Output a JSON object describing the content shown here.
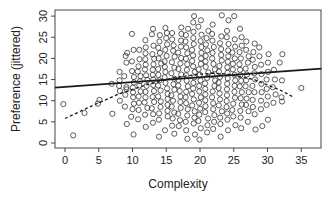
{
  "chart_data": {
    "type": "scatter",
    "title": "",
    "xlabel": "Complexity",
    "ylabel": "Preference (jittered)",
    "xlim": [
      -1.5,
      38
    ],
    "ylim": [
      -0.5,
      31
    ],
    "x_ticks": [
      0,
      5,
      10,
      15,
      20,
      25,
      30,
      35
    ],
    "y_ticks": [
      0,
      5,
      10,
      15,
      20,
      25,
      30
    ],
    "grid": false,
    "legend": null,
    "point_style": "open circle",
    "columns": [
      {
        "x": 0,
        "y": [
          9.2
        ]
      },
      {
        "x": 1,
        "y": [
          1.8
        ]
      },
      {
        "x": 3,
        "y": [
          7.1
        ]
      },
      {
        "x": 5,
        "y": [
          9.3,
          10.2
        ]
      },
      {
        "x": 7,
        "y": [
          6.9,
          14.0
        ]
      },
      {
        "x": 8,
        "y": [
          10.0,
          12.3,
          13.5,
          14.8,
          16.8
        ]
      },
      {
        "x": 9,
        "y": [
          4.5,
          8.6,
          11.4,
          12.7,
          13.2,
          15.8,
          19.0,
          20.6,
          21.3
        ]
      },
      {
        "x": 10,
        "y": [
          2.0,
          6.2,
          8.0,
          9.3,
          10.8,
          12.0,
          13.1,
          14.3,
          15.6,
          17.0,
          19.3,
          22.0,
          25.8
        ]
      },
      {
        "x": 11,
        "y": [
          5.6,
          7.8,
          9.5,
          11.0,
          12.2,
          13.6,
          14.6,
          15.8,
          16.9,
          18.1,
          19.8,
          22.0
        ]
      },
      {
        "x": 12,
        "y": [
          3.8,
          6.7,
          8.3,
          9.6,
          10.8,
          12.1,
          13.5,
          14.9,
          16.0,
          17.4,
          18.5,
          19.8,
          21.2,
          22.6,
          24.3
        ]
      },
      {
        "x": 13,
        "y": [
          4.8,
          6.8,
          8.2,
          9.7,
          10.9,
          12.3,
          13.7,
          15.0,
          16.1,
          17.3,
          18.6,
          19.9,
          21.0,
          23.0,
          25.7,
          27.0
        ]
      },
      {
        "x": 14,
        "y": [
          1.5,
          5.5,
          7.0,
          8.5,
          9.8,
          11.0,
          12.4,
          13.6,
          14.8,
          16.1,
          17.5,
          18.8,
          20.0,
          21.3,
          22.5,
          24.0,
          25.5
        ]
      },
      {
        "x": 15,
        "y": [
          3.0,
          6.3,
          7.6,
          9.0,
          10.4,
          11.6,
          12.9,
          14.2,
          15.5,
          16.8,
          18.0,
          19.3,
          20.6,
          22.0,
          23.3,
          24.8,
          26.0,
          27.2
        ]
      },
      {
        "x": 16,
        "y": [
          2.2,
          4.1,
          5.8,
          7.2,
          8.6,
          10.0,
          11.3,
          12.6,
          13.9,
          15.2,
          16.5,
          17.8,
          19.1,
          20.4,
          21.8,
          23.1,
          24.5,
          26.0
        ]
      },
      {
        "x": 17,
        "y": [
          4.0,
          5.4,
          6.9,
          8.3,
          9.7,
          11.0,
          12.3,
          13.6,
          14.9,
          16.2,
          17.5,
          18.8,
          20.1,
          21.4,
          22.8,
          24.2,
          25.8,
          27.3
        ]
      },
      {
        "x": 18,
        "y": [
          1.0,
          3.0,
          5.0,
          6.5,
          8.0,
          9.4,
          10.8,
          12.1,
          13.4,
          14.7,
          16.0,
          17.3,
          18.6,
          19.9,
          21.2,
          22.6,
          24.0,
          25.5,
          27.0
        ]
      },
      {
        "x": 19,
        "y": [
          2.0,
          4.6,
          6.0,
          7.5,
          8.9,
          10.3,
          11.6,
          12.9,
          14.2,
          15.5,
          16.8,
          18.1,
          19.4,
          20.7,
          22.0,
          23.4,
          24.8,
          26.3,
          28.5,
          30.0
        ]
      },
      {
        "x": 20,
        "y": [
          0.8,
          3.5,
          5.2,
          6.7,
          8.1,
          9.5,
          10.8,
          12.2,
          13.5,
          14.8,
          16.1,
          17.4,
          18.7,
          20.0,
          21.3,
          22.7,
          24.1,
          25.6,
          27.5,
          29.0
        ]
      },
      {
        "x": 21,
        "y": [
          2.5,
          4.2,
          5.8,
          7.3,
          8.7,
          10.1,
          11.5,
          12.8,
          14.1,
          15.4,
          16.7,
          18.0,
          19.3,
          20.6,
          21.9,
          23.3,
          24.8,
          26.5
        ]
      },
      {
        "x": 22,
        "y": [
          3.3,
          5.0,
          6.6,
          8.0,
          9.4,
          10.8,
          12.2,
          13.5,
          14.8,
          16.1,
          17.4,
          18.7,
          20.0,
          21.3,
          22.7,
          24.2,
          25.8,
          28.0
        ]
      },
      {
        "x": 23,
        "y": [
          1.5,
          4.5,
          6.0,
          7.5,
          8.9,
          10.3,
          11.7,
          13.0,
          14.3,
          15.6,
          16.9,
          18.2,
          19.5,
          20.8,
          22.2,
          23.6,
          25.2,
          30.2
        ]
      },
      {
        "x": 24,
        "y": [
          3.0,
          5.5,
          7.0,
          8.5,
          9.9,
          11.3,
          12.7,
          14.0,
          15.3,
          16.6,
          17.9,
          19.2,
          20.5,
          21.9,
          23.4,
          25.0,
          26.5,
          29.0
        ]
      },
      {
        "x": 25,
        "y": [
          4.2,
          6.3,
          7.8,
          9.3,
          10.7,
          12.1,
          13.5,
          14.8,
          16.1,
          17.4,
          18.7,
          20.0,
          21.4,
          22.8,
          24.5,
          30.0
        ]
      },
      {
        "x": 26,
        "y": [
          3.5,
          6.0,
          7.6,
          9.1,
          10.6,
          12.0,
          13.4,
          14.7,
          16.0,
          17.3,
          18.6,
          20.0,
          21.5,
          23.0,
          25.0,
          27.0
        ]
      },
      {
        "x": 27,
        "y": [
          5.0,
          7.5,
          9.0,
          10.5,
          12.0,
          13.4,
          14.8,
          16.2,
          17.6,
          19.0,
          20.5,
          22.0,
          24.0
        ]
      },
      {
        "x": 28,
        "y": [
          3.2,
          6.8,
          8.5,
          10.2,
          12.0,
          13.5,
          15.0,
          16.5,
          18.0,
          19.7,
          21.5,
          23.5
        ]
      },
      {
        "x": 29,
        "y": [
          4.0,
          8.0,
          10.0,
          12.0,
          14.0,
          16.3,
          18.5,
          20.5,
          22.6
        ]
      },
      {
        "x": 30,
        "y": [
          5.5,
          9.0,
          11.0,
          12.8,
          15.0,
          16.8,
          19.0,
          21.0
        ]
      },
      {
        "x": 31,
        "y": [
          9.5,
          11.5,
          13.2,
          15.0,
          17.3
        ]
      },
      {
        "x": 32,
        "y": [
          9.8,
          10.8,
          14.8,
          19.0,
          21.0
        ]
      },
      {
        "x": 35,
        "y": [
          13.0
        ]
      }
    ],
    "lines": [
      {
        "name": "linear fit",
        "style": "solid",
        "x": [
          -1.5,
          38
        ],
        "y": [
          13.1,
          17.6
        ]
      },
      {
        "name": "quadratic fit",
        "style": "dashed",
        "x": [
          0,
          4,
          8,
          12,
          16,
          20,
          22,
          24,
          28,
          32,
          34
        ],
        "y": [
          5.8,
          8.8,
          11.6,
          13.7,
          15.4,
          16.3,
          16.5,
          16.3,
          15.0,
          12.4,
          10.7
        ]
      }
    ]
  },
  "plot_area": {
    "left": 55,
    "right": 321,
    "top": 10,
    "bottom": 148
  },
  "axis_pixels": {
    "x0": 65,
    "x_per_unit": 6.75,
    "y0": 143,
    "y_per_unit": 4.23
  },
  "colors": {
    "point_stroke": "#333333",
    "line": "#1a1a1a",
    "axis": "#444444",
    "background": "#ffffff"
  }
}
